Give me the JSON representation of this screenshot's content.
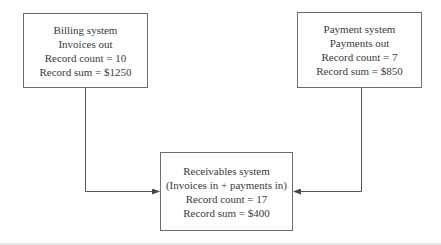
{
  "diagram": {
    "nodes": [
      {
        "id": "billing",
        "title": "Billing system",
        "subtitle": "Invoices out",
        "count_line": "Record count = 10",
        "sum_line": "Record sum = $1250"
      },
      {
        "id": "payment",
        "title": "Payment system",
        "subtitle": "Payments out",
        "count_line": "Record count = 7",
        "sum_line": "Record sum = $850"
      },
      {
        "id": "receivables",
        "title": "Receivables system",
        "subtitle": "(Invoices in + payments in)",
        "count_line": "Record count = 17",
        "sum_line": "Record sum = $400"
      }
    ],
    "edges": [
      {
        "from": "billing",
        "to": "receivables"
      },
      {
        "from": "payment",
        "to": "receivables"
      }
    ],
    "colors": {
      "border": "#6d6d6d",
      "line": "#555555",
      "text": "#3a3a3a"
    }
  }
}
